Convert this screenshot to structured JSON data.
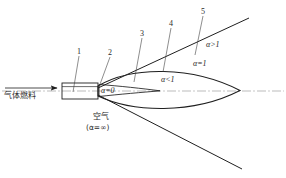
{
  "figure": {
    "background_color": "#ffffff",
    "line_color": "#1f1f1f",
    "centerline_color": "#9a9a9a"
  },
  "inlet": {
    "flow_label": "气体燃料",
    "arrow_name": "fuel-flow-arrow"
  },
  "air": {
    "label": "空气",
    "sub_label": "(α=∞)"
  },
  "zones": [
    {
      "id": "zone-alpha-zero",
      "label": "α=0",
      "symbol": "α",
      "op": "=",
      "value": "0"
    },
    {
      "id": "zone-alpha-lt1",
      "label": "α<1",
      "symbol": "α",
      "op": "<",
      "value": "1"
    },
    {
      "id": "zone-alpha-eq1",
      "label": "α=1",
      "symbol": "α",
      "op": "=",
      "value": "1"
    },
    {
      "id": "zone-alpha-gt1",
      "label": "α>1",
      "symbol": "α",
      "op": ">",
      "value": "1"
    }
  ],
  "callouts": [
    {
      "id": "callout-1",
      "label": "1"
    },
    {
      "id": "callout-2",
      "label": "2"
    },
    {
      "id": "callout-3",
      "label": "3"
    },
    {
      "id": "callout-4",
      "label": "4"
    },
    {
      "id": "callout-5",
      "label": "5"
    }
  ]
}
